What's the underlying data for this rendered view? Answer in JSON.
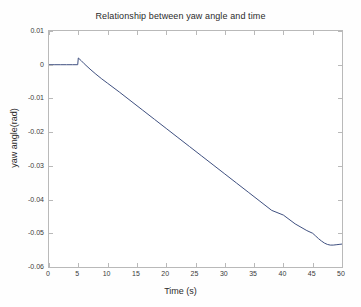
{
  "chart_data": {
    "type": "line",
    "title": "Relationship between yaw angle and time",
    "xlabel": "Time (s)",
    "ylabel": "yaw angle(rad)",
    "xlim": [
      0,
      50
    ],
    "ylim": [
      -0.06,
      0.01
    ],
    "grid": false,
    "legend": null,
    "xticks": [
      0,
      5,
      10,
      15,
      20,
      25,
      30,
      35,
      40,
      45,
      50
    ],
    "xtick_labels": [
      "0",
      "5",
      "10",
      "15",
      "20",
      "25",
      "30",
      "35",
      "40",
      "45",
      "50"
    ],
    "yticks": [
      0.01,
      0,
      -0.01,
      -0.02,
      -0.03,
      -0.04,
      -0.05,
      -0.06
    ],
    "ytick_labels": [
      "0.01",
      "0",
      "-0.01",
      "-0.02",
      "-0.03",
      "-0.04",
      "-0.05",
      "-0.06"
    ],
    "line_color": "#3f5080",
    "line_width": 1,
    "series": [
      {
        "name": "yaw angle",
        "x": [
          0,
          1,
          2,
          3,
          4,
          4.9,
          5,
          5.5,
          6,
          7,
          8,
          9,
          10,
          12,
          14,
          16,
          18,
          20,
          22,
          24,
          26,
          28,
          30,
          32,
          34,
          36,
          38,
          40,
          42,
          43,
          44,
          45,
          45.5,
          46,
          46.5,
          47,
          47.5,
          48,
          48.5,
          49,
          49.5,
          50
        ],
        "y": [
          0,
          0,
          0,
          0,
          0,
          0,
          0.002,
          0.0012,
          0.0003,
          -0.0013,
          -0.0028,
          -0.0042,
          -0.0055,
          -0.0081,
          -0.0108,
          -0.0135,
          -0.0162,
          -0.0189,
          -0.0216,
          -0.0243,
          -0.027,
          -0.0297,
          -0.0324,
          -0.0351,
          -0.0378,
          -0.0405,
          -0.0432,
          -0.0446,
          -0.0472,
          -0.0482,
          -0.0492,
          -0.05,
          -0.0508,
          -0.0516,
          -0.0523,
          -0.0529,
          -0.0533,
          -0.0535,
          -0.0535,
          -0.0534,
          -0.0533,
          -0.0532
        ]
      }
    ]
  }
}
